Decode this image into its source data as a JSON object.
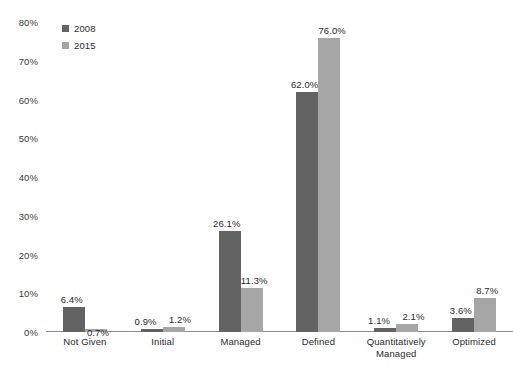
{
  "chart_data": {
    "type": "bar",
    "title": "",
    "subtitle": "",
    "xlabel": "",
    "ylabel": "",
    "ylim": [
      0,
      80
    ],
    "ytick_labels": [
      "80%",
      "70%",
      "60%",
      "50%",
      "40%",
      "30%",
      "20%",
      "10%",
      "0%"
    ],
    "ytick_values": [
      80,
      70,
      60,
      50,
      40,
      30,
      20,
      10,
      0
    ],
    "grid": false,
    "legend_position": "top-left",
    "categories": [
      "Not Given",
      "Initial",
      "Managed",
      "Defined",
      "Quantitatively\nManaged",
      "Optimized"
    ],
    "series": [
      {
        "name": "2008",
        "color": "#636363",
        "values": [
          6.4,
          0.9,
          26.1,
          62.0,
          1.1,
          3.6
        ],
        "labels": [
          "6.4%",
          "0.9%",
          "26.1%",
          "62.0%",
          "1.1%",
          "3.6%"
        ]
      },
      {
        "name": "2015",
        "color": "#a6a6a6",
        "values": [
          0.7,
          1.2,
          11.3,
          76.0,
          2.1,
          8.7
        ],
        "labels": [
          "0.7%",
          "1.2%",
          "11.3%",
          "76.0%",
          "2.1%",
          "8.7%"
        ]
      }
    ]
  },
  "legend": {
    "items": [
      {
        "label": "2008",
        "color": "#636363"
      },
      {
        "label": "2015",
        "color": "#a6a6a6"
      }
    ]
  },
  "axes": {
    "baseline_color": "#8c8c8c"
  }
}
